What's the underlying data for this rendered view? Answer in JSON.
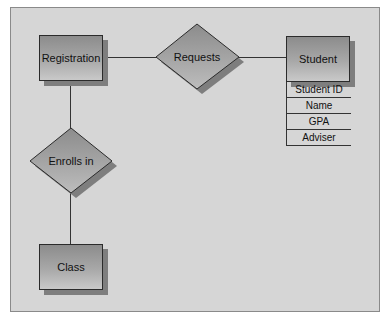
{
  "diagram": {
    "type": "entity-relationship",
    "entities": [
      {
        "id": "registration",
        "label": "Registration"
      },
      {
        "id": "student",
        "label": "Student",
        "attributes": [
          "Student ID",
          "Name",
          "GPA",
          "Adviser"
        ]
      },
      {
        "id": "class",
        "label": "Class"
      }
    ],
    "relationships": [
      {
        "id": "requests",
        "label": "Requests",
        "from": "registration",
        "to": "student"
      },
      {
        "id": "enrolls_in",
        "label": "Enrolls in",
        "from": "registration",
        "to": "class"
      }
    ],
    "colors": {
      "background": "#d6d6d6",
      "shape_fill_dark": "#8c8c8c",
      "shape_fill_light": "#c9c9c9",
      "shadow": "#7e7e7e",
      "line": "#333333"
    }
  }
}
